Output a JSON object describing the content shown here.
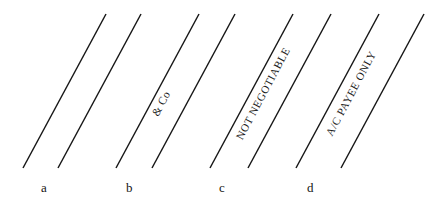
{
  "figure": {
    "type": "cheque-crossing-types-diagram",
    "width": 438,
    "height": 215,
    "background_color": "#ffffff",
    "line_color": "#161616",
    "text_color": "#1a1a1a",
    "line_angle_degrees_from_vertical": 28,
    "line_top_y": 14,
    "line_bottom_y": 168
  },
  "panels": [
    {
      "label": "a",
      "label_x": 45,
      "label_y": 188,
      "caption": "",
      "caption_present": false,
      "lines": [
        {
          "x_bottom": 23,
          "x_top": 106
        },
        {
          "x_bottom": 58,
          "x_top": 141
        }
      ]
    },
    {
      "label": "b",
      "label_x": 130,
      "label_y": 188,
      "caption": "& Co",
      "caption_present": true,
      "caption_center_x": 162,
      "caption_center_y": 104,
      "lines": [
        {
          "x_bottom": 116,
          "x_top": 199
        },
        {
          "x_bottom": 152,
          "x_top": 235
        }
      ]
    },
    {
      "label": "c",
      "label_x": 222,
      "label_y": 188,
      "caption": "NOT NEGOTIABLE",
      "caption_present": true,
      "caption_center_x": 262,
      "caption_center_y": 96,
      "lines": [
        {
          "x_bottom": 210,
          "x_top": 293
        },
        {
          "x_bottom": 248,
          "x_top": 331
        }
      ]
    },
    {
      "label": "d",
      "label_x": 310,
      "label_y": 188,
      "caption": "A/C PAYEE ONLY",
      "caption_present": true,
      "caption_center_x": 350,
      "caption_center_y": 96,
      "lines": [
        {
          "x_bottom": 296,
          "x_top": 379
        },
        {
          "x_bottom": 341,
          "x_top": 424
        }
      ]
    }
  ],
  "captions": {
    "panel_b": "& Co",
    "panel_c": "NOT NEGOTIABLE",
    "panel_d": "A/C PAYEE ONLY"
  },
  "labels": {
    "panel_a": "a",
    "panel_b": "b",
    "panel_c": "c",
    "panel_d": "d"
  }
}
